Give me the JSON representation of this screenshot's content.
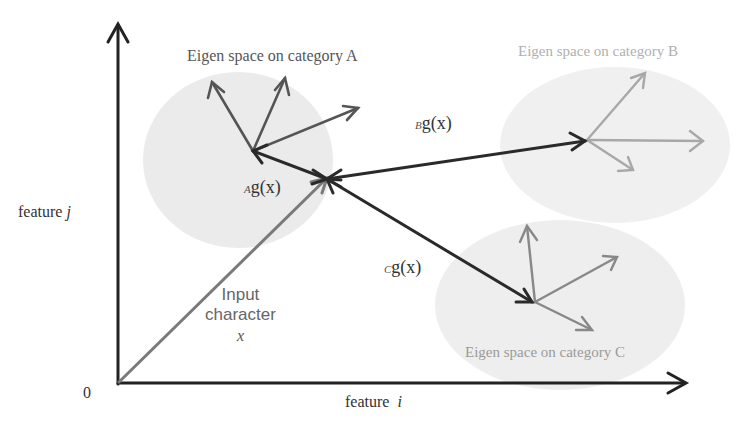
{
  "diagram": {
    "axes": {
      "x_label": "feature",
      "x_var": "i",
      "y_label": "feature",
      "y_var": "j",
      "origin_label": "0"
    },
    "input": {
      "line1": "Input",
      "line2": "character",
      "var": "x"
    },
    "categories": [
      {
        "id": "A",
        "title": "Eigen space on category A",
        "distance_sub": "A",
        "distance_label": "g(x)",
        "color": "#555555",
        "vector_color": "#555555"
      },
      {
        "id": "B",
        "title": "Eigen space on category B",
        "distance_sub": "B",
        "distance_label": "g(x)",
        "color": "#b0b0b0",
        "vector_color": "#a8a8a8"
      },
      {
        "id": "C",
        "title": "Eigen space on category C",
        "distance_sub": "C",
        "distance_label": "g(x)",
        "color": "#9a9a9a",
        "vector_color": "#888888"
      }
    ],
    "colors": {
      "axis": "#222222",
      "input_vector": "#7a7a7a",
      "distance_vectors": "#2a2a2a",
      "blob_fill": "#ececec"
    }
  }
}
